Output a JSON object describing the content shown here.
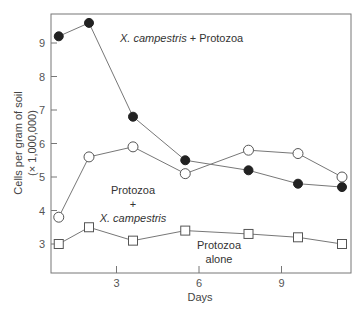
{
  "chart_data": {
    "type": "line",
    "title": "",
    "xlabel": "Days",
    "ylabel": "Cells per gram of soil",
    "ylabel_sub": "(× 1,000,000)",
    "xlim": [
      0.6,
      11.5
    ],
    "ylim": [
      2.1,
      9.9
    ],
    "xticks": [
      3,
      6,
      9
    ],
    "yticks": [
      3,
      4,
      5,
      6,
      7,
      8,
      9
    ],
    "grid": false,
    "legend": "inline annotations",
    "x": [
      0.9,
      2.0,
      3.6,
      5.5,
      7.8,
      9.6,
      11.2
    ],
    "series": [
      {
        "name": "X. campestris + Protozoa",
        "marker": "filled-circle",
        "values": [
          9.2,
          9.6,
          6.8,
          5.5,
          5.2,
          4.8,
          4.7
        ]
      },
      {
        "name": "Protozoa + X. campestris",
        "marker": "open-circle",
        "values": [
          3.8,
          5.6,
          5.9,
          5.1,
          5.8,
          5.7,
          5.0
        ]
      },
      {
        "name": "Protozoa alone",
        "marker": "open-square",
        "values": [
          3.0,
          3.5,
          3.1,
          3.4,
          3.3,
          3.2,
          3.0
        ]
      }
    ],
    "annotations": {
      "filled_italic": "X. campestris",
      "filled_rest": " + Protozoa",
      "open_line1": "Protozoa",
      "open_line2": "+",
      "open_line3": "X. campestris",
      "square_line1": "Protozoa",
      "square_line2": "alone"
    }
  }
}
